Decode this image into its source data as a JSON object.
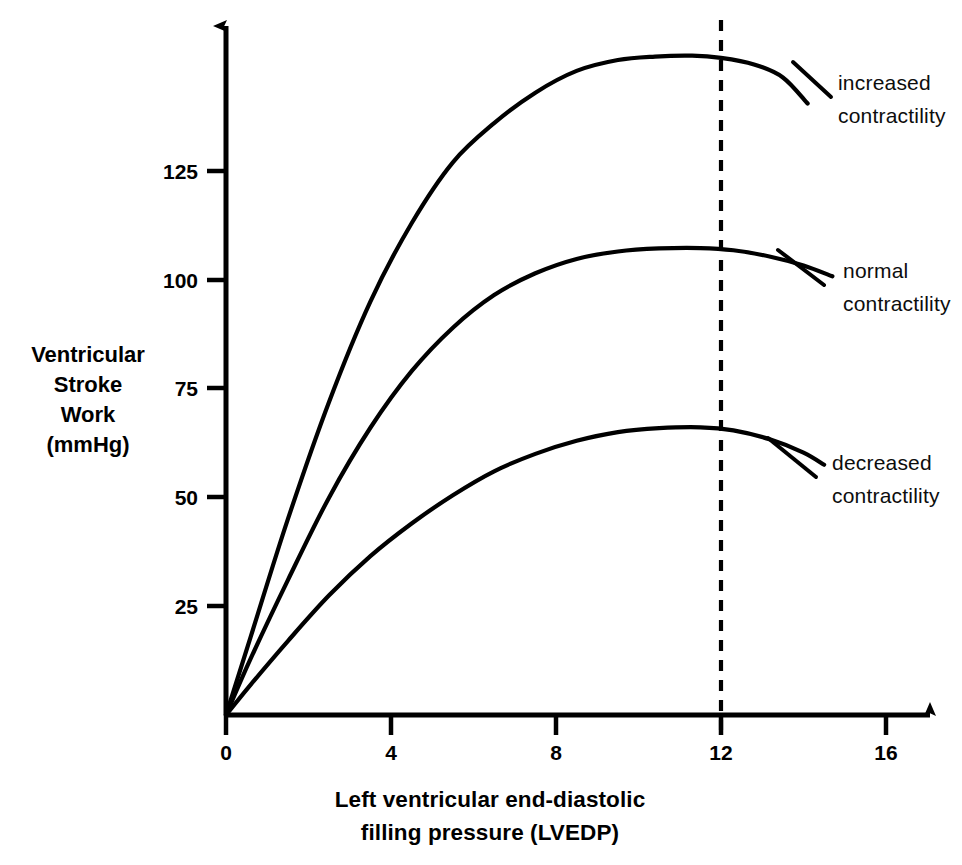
{
  "figure": {
    "name": "ventricular-function-curves",
    "background_color": "#ffffff",
    "ink_color": "#000000"
  },
  "chart_data": {
    "type": "line",
    "title": "",
    "subtitle": "",
    "xlabel": "Left ventricular end-diastolic filling pressure (LVEDP)",
    "xlabel_line1": "Left ventricular end-diastolic",
    "xlabel_line2": "filling pressure (LVEDP)",
    "ylabel": "Ventricular Stroke Work (mmHg)",
    "ylabel_line1": "Ventricular",
    "ylabel_line2": "Stroke",
    "ylabel_line3": "Work",
    "ylabel_line4": "(mmHg)",
    "xlim": [
      0,
      17.5
    ],
    "ylim": [
      0,
      162
    ],
    "xticks": [
      0,
      4,
      8,
      12,
      16
    ],
    "xtick_labels": [
      "0",
      "4",
      "8",
      "12",
      "16"
    ],
    "yticks": [
      25,
      50,
      75,
      100,
      125
    ],
    "ytick_labels": [
      "25",
      "50",
      "75",
      "100",
      "125"
    ],
    "grid": false,
    "legend_position": "inline-right-annotations",
    "axes_style": "arrowed-open",
    "annotations": [
      {
        "name": "reference-line-lvedp-12",
        "type": "vertical-dashed-line",
        "x": 12,
        "label": ""
      }
    ],
    "series": [
      {
        "name": "increased contractility",
        "label_line1": "increased",
        "label_line2": "contractility",
        "color": "#000000",
        "peak": {
          "x": 11.3,
          "y": 151
        },
        "x": [
          0.0,
          0.6,
          1.5,
          2.5,
          3.5,
          4.5,
          5.5,
          6.5,
          7.5,
          8.5,
          9.5,
          10.4,
          11.3,
          12.0,
          12.8,
          13.5,
          14.1
        ],
        "y": [
          0,
          18,
          45,
          72,
          95,
          113,
          127,
          136,
          143,
          148,
          150.5,
          151.3,
          151.5,
          151.0,
          149.5,
          146.5,
          140.5
        ]
      },
      {
        "name": "normal contractility",
        "label_line1": "normal",
        "label_line2": "contractility",
        "color": "#000000",
        "peak": {
          "x": 11.9,
          "y": 107
        },
        "x": [
          0.0,
          0.6,
          1.5,
          2.5,
          3.5,
          4.5,
          5.5,
          6.5,
          7.5,
          8.5,
          9.5,
          10.5,
          11.5,
          12.3,
          13.2,
          14.0,
          14.7
        ],
        "y": [
          0,
          13,
          31,
          50,
          66,
          79,
          89,
          96.5,
          101.5,
          104.8,
          106.5,
          107.2,
          107.3,
          106.8,
          105.3,
          103.3,
          100.8
        ]
      },
      {
        "name": "decreased contractility",
        "label_line1": "decreased",
        "label_line2": "contractility",
        "color": "#000000",
        "peak": {
          "x": 11.5,
          "y": 66
        },
        "x": [
          0.0,
          0.6,
          1.5,
          2.5,
          3.5,
          4.5,
          5.5,
          6.5,
          7.5,
          8.5,
          9.5,
          10.5,
          11.5,
          12.3,
          13.2,
          14.0,
          14.5
        ],
        "y": [
          0,
          7,
          17,
          27.5,
          36.5,
          44,
          50.5,
          56,
          60,
          63,
          65,
          65.9,
          66.1,
          65.4,
          63.3,
          60.3,
          57.5
        ]
      }
    ]
  }
}
